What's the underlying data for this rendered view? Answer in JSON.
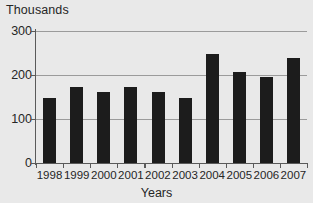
{
  "chart_data": {
    "type": "bar",
    "title": "Thousands",
    "xlabel": "Years",
    "ylabel": "Thousands",
    "categories": [
      "1998",
      "1999",
      "2000",
      "2001",
      "2002",
      "2003",
      "2004",
      "2005",
      "2006",
      "2007"
    ],
    "values": [
      148,
      172,
      162,
      173,
      162,
      148,
      248,
      208,
      195,
      238
    ],
    "ylim": [
      0,
      300
    ],
    "yticks": [
      0,
      100,
      200,
      300
    ],
    "ytick_labels": [
      "0",
      "100",
      "200",
      "300"
    ],
    "grid": true,
    "legend": null,
    "bar_color": "#1c1c1c",
    "background_color": "#e9e9e9",
    "gridline_color": "#9b9b9b",
    "axis_color": "#5a5a5a",
    "text_color": "#262626"
  }
}
